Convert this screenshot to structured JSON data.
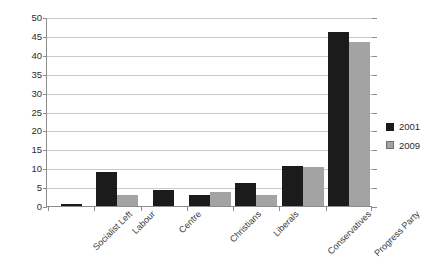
{
  "chart_data": {
    "type": "bar",
    "title": "",
    "xlabel": "",
    "ylabel": "",
    "ylim": [
      0,
      50
    ],
    "yticks": [
      0,
      5,
      10,
      15,
      20,
      25,
      30,
      35,
      40,
      45,
      50
    ],
    "grid": true,
    "legend_position": "right",
    "categories": [
      "Socialist Left",
      "Labour",
      "Centre",
      "Christians",
      "Liberals",
      "Conservatives",
      "Progress Party"
    ],
    "series": [
      {
        "name": "2001",
        "color": "#1b1b1b",
        "values": [
          0.5,
          9.0,
          4.3,
          3.0,
          6.0,
          10.6,
          46.0
        ]
      },
      {
        "name": "2009",
        "color": "#a3a3a3",
        "values": [
          0,
          3.0,
          0,
          3.8,
          2.8,
          10.4,
          43.3
        ]
      }
    ]
  },
  "legend": {
    "items": [
      {
        "label": "2001"
      },
      {
        "label": "2009"
      }
    ]
  }
}
